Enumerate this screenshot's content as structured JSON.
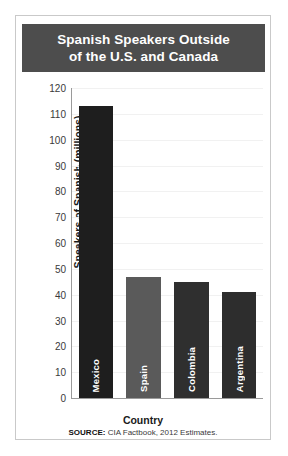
{
  "card": {
    "title_line_1": "Spanish Speakers Outside",
    "title_line_2": "of the U.S. and Canada",
    "title_bg_color": "#4d4d4d",
    "title_text_color": "#ffffff",
    "border_color": "#c9c9c9",
    "background_color": "#ffffff"
  },
  "footer": {
    "source_label": "SOURCE:",
    "source_text": " CIA Factbook, 2012 Estimates."
  },
  "chart_data": {
    "type": "bar",
    "title": "Spanish Speakers Outside of the U.S. and Canada",
    "categories": [
      "Mexico",
      "Spain",
      "Colombia",
      "Argentina"
    ],
    "values": [
      113,
      47,
      45,
      41
    ],
    "bar_colors": [
      "#1e1e1e",
      "#5a5a5a",
      "#2f2f2f",
      "#2d2d2d"
    ],
    "xlabel": "Country",
    "ylabel": "Speakers of Spanish (millions)",
    "ylim": [
      0,
      120
    ],
    "ytick_step": 10,
    "yticks": [
      0,
      10,
      20,
      30,
      40,
      50,
      60,
      70,
      80,
      90,
      100,
      110,
      120
    ],
    "ytick_labels": [
      "0",
      "10",
      "20",
      "30",
      "40",
      "50",
      "60",
      "70",
      "80",
      "90",
      "100",
      "110",
      "120"
    ],
    "grid": true,
    "grid_color": "#f1f1f1",
    "axis_color": "#9a9a9a",
    "legend": false,
    "bar_label_color": "#ffffff",
    "bar_label_orientation": "vertical"
  }
}
